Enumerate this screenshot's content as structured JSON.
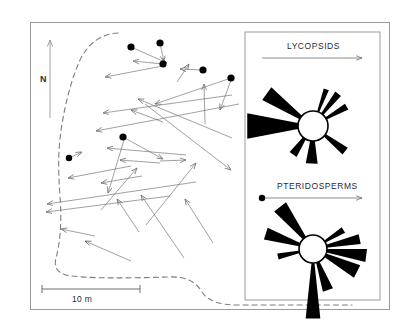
{
  "figure": {
    "type": "fossil-forest-map",
    "background": "#ffffff",
    "frame_color": "#9a9a9a",
    "line_color": "#6e6e6e",
    "trunk_color": "#000000",
    "petal_color": "#000000"
  },
  "map": {
    "north_arrow": {
      "label": "N",
      "x": 50,
      "y_top": 40,
      "y_bottom": 118
    },
    "scale_bar": {
      "label": "10 m",
      "x1": 42,
      "x2": 140,
      "y": 289
    },
    "outcrop_boundary_style": "dashed",
    "outcrop_boundary_path": "M 118 33 C 100 34 88 44 80 60 C 72 78 66 100 62 124 C 58 148 58 170 60 196 C 62 222 60 244 56 258 C 54 266 56 272 66 275 C 86 279 132 278 168 277 C 186 276 196 282 202 292 C 208 301 220 305 238 305 C 262 305 310 305 352 305",
    "trunk_dots": [
      {
        "x": 131,
        "y": 47,
        "r": 3.6
      },
      {
        "x": 160,
        "y": 43,
        "r": 3.6
      },
      {
        "x": 163,
        "y": 64,
        "r": 3.6
      },
      {
        "x": 203,
        "y": 70,
        "r": 3.6
      },
      {
        "x": 231,
        "y": 78,
        "r": 3.6
      },
      {
        "x": 123,
        "y": 137,
        "r": 3.6
      },
      {
        "x": 69,
        "y": 158,
        "r": 3.2
      }
    ],
    "fallen_logs": [
      {
        "x1": 131,
        "y1": 47,
        "x2": 167,
        "y2": 63
      },
      {
        "x1": 160,
        "y1": 43,
        "x2": 164,
        "y2": 62
      },
      {
        "x1": 163,
        "y1": 64,
        "x2": 133,
        "y2": 61
      },
      {
        "x1": 163,
        "y1": 66,
        "x2": 105,
        "y2": 77
      },
      {
        "x1": 177,
        "y1": 82,
        "x2": 189,
        "y2": 64
      },
      {
        "x1": 203,
        "y1": 70,
        "x2": 180,
        "y2": 69
      },
      {
        "x1": 231,
        "y1": 78,
        "x2": 155,
        "y2": 104
      },
      {
        "x1": 231,
        "y1": 80,
        "x2": 220,
        "y2": 110
      },
      {
        "x1": 205,
        "y1": 124,
        "x2": 204,
        "y2": 84
      },
      {
        "x1": 232,
        "y1": 95,
        "x2": 103,
        "y2": 113
      },
      {
        "x1": 163,
        "y1": 122,
        "x2": 131,
        "y2": 110
      },
      {
        "x1": 239,
        "y1": 104,
        "x2": 96,
        "y2": 131
      },
      {
        "x1": 232,
        "y1": 138,
        "x2": 138,
        "y2": 99
      },
      {
        "x1": 145,
        "y1": 104,
        "x2": 231,
        "y2": 170
      },
      {
        "x1": 123,
        "y1": 137,
        "x2": 163,
        "y2": 159
      },
      {
        "x1": 160,
        "y1": 163,
        "x2": 120,
        "y2": 160
      },
      {
        "x1": 160,
        "y1": 161,
        "x2": 186,
        "y2": 160
      },
      {
        "x1": 124,
        "y1": 140,
        "x2": 108,
        "y2": 193
      },
      {
        "x1": 69,
        "y1": 158,
        "x2": 82,
        "y2": 152
      },
      {
        "x1": 131,
        "y1": 166,
        "x2": 68,
        "y2": 178
      },
      {
        "x1": 142,
        "y1": 176,
        "x2": 101,
        "y2": 183
      },
      {
        "x1": 186,
        "y1": 155,
        "x2": 107,
        "y2": 148
      },
      {
        "x1": 196,
        "y1": 182,
        "x2": 47,
        "y2": 204
      },
      {
        "x1": 170,
        "y1": 196,
        "x2": 46,
        "y2": 212
      },
      {
        "x1": 139,
        "y1": 232,
        "x2": 117,
        "y2": 199
      },
      {
        "x1": 184,
        "y1": 258,
        "x2": 141,
        "y2": 195
      },
      {
        "x1": 131,
        "y1": 261,
        "x2": 85,
        "y2": 241
      },
      {
        "x1": 95,
        "y1": 236,
        "x2": 61,
        "y2": 229
      },
      {
        "x1": 146,
        "y1": 225,
        "x2": 196,
        "y2": 163
      },
      {
        "x1": 213,
        "y1": 243,
        "x2": 185,
        "y2": 199
      },
      {
        "x1": 101,
        "y1": 210,
        "x2": 137,
        "y2": 168
      }
    ]
  },
  "legend": {
    "panel": {
      "x": 245,
      "y": 32,
      "width": 135,
      "height": 268
    },
    "sections": [
      {
        "title": "LYCOPSIDS",
        "arrow": {
          "x1": 262,
          "x2": 362,
          "y": 58,
          "has_base_dot": false
        },
        "rose": {
          "center_x": 313,
          "center_y": 126,
          "radius": 15,
          "petals": [
            {
              "direction_deg": 270,
              "length": 52,
              "half_width_deg": 11,
              "label": "W"
            },
            {
              "direction_deg": 305,
              "length": 42,
              "half_width_deg": 8,
              "label": "NW"
            },
            {
              "direction_deg": 20,
              "length": 24,
              "half_width_deg": 4,
              "label": "NNE"
            },
            {
              "direction_deg": 38,
              "length": 26,
              "half_width_deg": 5,
              "label": "NE"
            },
            {
              "direction_deg": 60,
              "length": 24,
              "half_width_deg": 5,
              "label": "ENE"
            },
            {
              "direction_deg": 128,
              "length": 26,
              "half_width_deg": 6,
              "label": "SE"
            },
            {
              "direction_deg": 182,
              "length": 23,
              "half_width_deg": 9,
              "label": "S"
            },
            {
              "direction_deg": 215,
              "length": 20,
              "half_width_deg": 7,
              "label": "SSW"
            }
          ]
        }
      },
      {
        "title": "PTERIDOSPERMS",
        "arrow": {
          "x1": 262,
          "x2": 362,
          "y": 198,
          "has_base_dot": true
        },
        "rose": {
          "center_x": 313,
          "center_y": 249,
          "radius": 14,
          "petals": [
            {
              "direction_deg": 180,
              "length": 56,
              "half_width_deg": 6,
              "label": "S"
            },
            {
              "direction_deg": 160,
              "length": 30,
              "half_width_deg": 7,
              "label": "SSE"
            },
            {
              "direction_deg": 117,
              "length": 36,
              "half_width_deg": 8,
              "label": "ESE"
            },
            {
              "direction_deg": 97,
              "length": 40,
              "half_width_deg": 7,
              "label": "E"
            },
            {
              "direction_deg": 78,
              "length": 34,
              "half_width_deg": 6,
              "label": "ENE"
            },
            {
              "direction_deg": 58,
              "length": 22,
              "half_width_deg": 5,
              "label": "NE"
            },
            {
              "direction_deg": 322,
              "length": 40,
              "half_width_deg": 8,
              "label": "NW"
            },
            {
              "direction_deg": 288,
              "length": 36,
              "half_width_deg": 7,
              "label": "WNW"
            },
            {
              "direction_deg": 258,
              "length": 22,
              "half_width_deg": 5,
              "label": "W"
            }
          ]
        }
      }
    ]
  }
}
